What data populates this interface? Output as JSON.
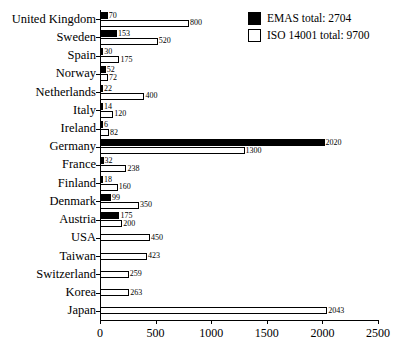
{
  "chart_data": {
    "type": "bar",
    "orientation": "horizontal",
    "title": "",
    "xlabel": "",
    "ylabel": "",
    "xlim": [
      0,
      2500
    ],
    "xticks": [
      0,
      500,
      1000,
      1500,
      2000,
      2500
    ],
    "xticklabels": [
      "0",
      "500",
      "1000",
      "1500",
      "2000",
      "2500"
    ],
    "grid": false,
    "legend_position": "top-right",
    "categories": [
      "United Kingdom",
      "Sweden",
      "Spain",
      "Norway",
      "Netherlands",
      "Italy",
      "Ireland",
      "Germany",
      "France",
      "Finland",
      "Denmark",
      "Austria",
      "USA",
      "Taiwan",
      "Switzerland",
      "Korea",
      "Japan"
    ],
    "series": [
      {
        "name": "EMAS",
        "legend_label": "EMAS total: 2704",
        "total": 2704,
        "color": "#000000",
        "fill": "solid",
        "values": [
          70,
          153,
          30,
          52,
          22,
          14,
          6,
          2020,
          32,
          18,
          99,
          175,
          null,
          null,
          null,
          null,
          null
        ],
        "value_labels": [
          "70",
          "153",
          "30",
          "52",
          "22",
          "14",
          "6",
          "2020",
          "32",
          "18",
          "99",
          "175",
          "",
          "",
          "",
          "",
          ""
        ]
      },
      {
        "name": "ISO 14001",
        "legend_label": "ISO 14001 total: 9700",
        "total": 9700,
        "color": "#ffffff",
        "fill": "outline",
        "values": [
          800,
          520,
          175,
          72,
          400,
          120,
          82,
          1300,
          238,
          160,
          350,
          200,
          450,
          423,
          259,
          263,
          2043
        ],
        "value_labels": [
          "800",
          "520",
          "175",
          "72",
          "400",
          "120",
          "82",
          "1300",
          "238",
          "160",
          "350",
          "200",
          "450",
          "423",
          "259",
          "263",
          "2043"
        ]
      }
    ]
  },
  "legend": {
    "items": [
      {
        "label": "EMAS total: 2704",
        "swatch": "filled-black-square"
      },
      {
        "label": "ISO 14001 total: 9700",
        "swatch": "outlined-white-square"
      }
    ]
  },
  "colors": {
    "emas": "#000000",
    "iso": "#ffffff",
    "axis": "#000000",
    "background": "#ffffff"
  }
}
